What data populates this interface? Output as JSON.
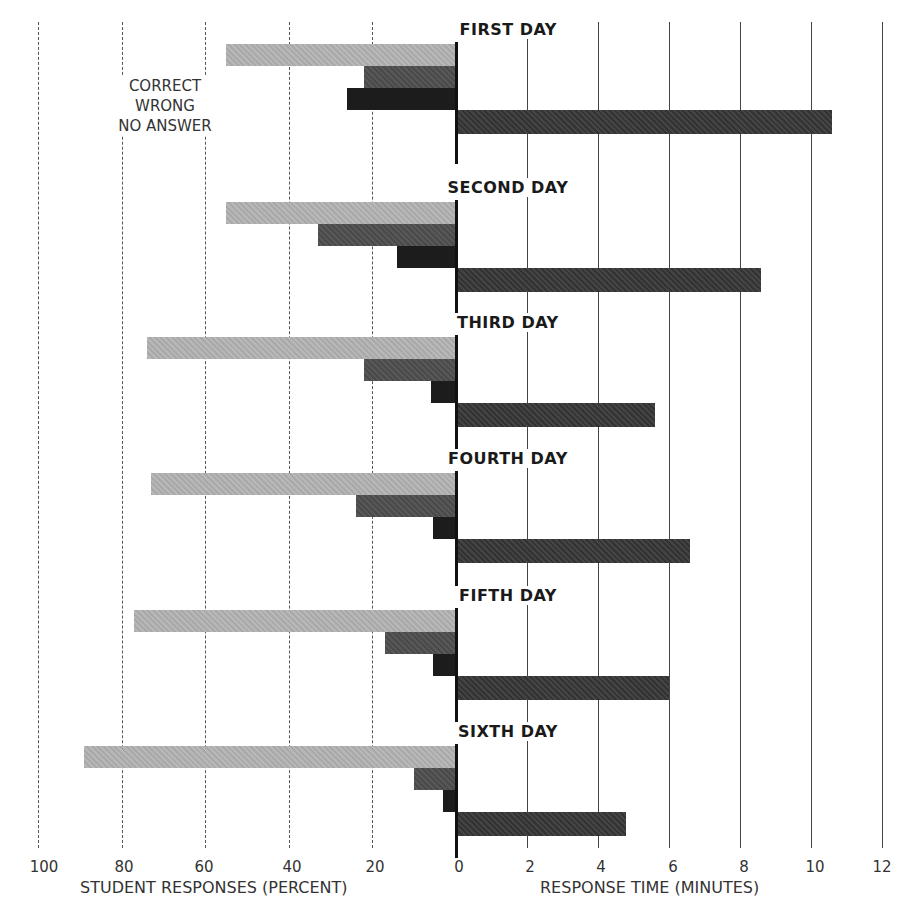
{
  "chart_data": {
    "type": "bar",
    "orientation": "horizontal",
    "title": "",
    "categories": [
      "FIRST DAY",
      "SECOND DAY",
      "THIRD DAY",
      "FOURTH DAY",
      "FIFTH DAY",
      "SIXTH DAY"
    ],
    "series": [
      {
        "name": "CORRECT",
        "axis": "left",
        "unit": "percent",
        "color": "#b0b0b0",
        "values": [
          55,
          55,
          74,
          73,
          77,
          89
        ]
      },
      {
        "name": "WRONG",
        "axis": "left",
        "unit": "percent",
        "color": "#505050",
        "values": [
          22,
          33,
          22,
          24,
          17,
          10
        ]
      },
      {
        "name": "NO ANSWER",
        "axis": "left",
        "unit": "percent",
        "color": "#1c1c1c",
        "values": [
          26,
          14,
          6,
          5.5,
          5.5,
          3
        ]
      },
      {
        "name": "RESPONSE TIME",
        "axis": "right",
        "unit": "minutes",
        "color": "#3a3a3a",
        "values": [
          10.6,
          8.6,
          5.6,
          6.6,
          6.0,
          4.8
        ]
      }
    ],
    "left_axis": {
      "label": "STUDENT RESPONSES (PERCENT)",
      "ticks": [
        "100",
        "80",
        "60",
        "40",
        "20",
        "0"
      ],
      "range": [
        100,
        0
      ]
    },
    "right_axis": {
      "label": "RESPONSE TIME (MINUTES)",
      "ticks": [
        "0",
        "2",
        "4",
        "6",
        "8",
        "10",
        "12"
      ],
      "range": [
        0,
        12
      ]
    },
    "legend": {
      "entries": [
        "CORRECT",
        "WRONG",
        "NO ANSWER"
      ],
      "position": "upper-left"
    },
    "grid": true
  },
  "legend": {
    "correct": "CORRECT",
    "wrong": "WRONG",
    "no_answer": "NO ANSWER"
  },
  "axes": {
    "left_label": "STUDENT RESPONSES (PERCENT)",
    "right_label": "RESPONSE TIME (MINUTES)",
    "left_ticks": [
      "100",
      "80",
      "60",
      "40",
      "20"
    ],
    "zero": "0",
    "right_ticks": [
      "2",
      "4",
      "6",
      "8",
      "10",
      "12"
    ]
  }
}
